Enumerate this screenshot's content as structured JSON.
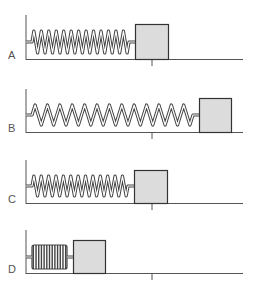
{
  "figure": {
    "colors": {
      "line": "#555555",
      "block_fill": "#dcdcdc",
      "block_stroke": "#333333",
      "spring_outer": "#444444",
      "spring_inner": "#ffffff"
    },
    "panels": [
      {
        "label": "A",
        "state": "equilibrium",
        "wall_x": 26,
        "wall_top": 15,
        "baseline_y": 59,
        "block": {
          "x": 135,
          "y": 24,
          "w": 33,
          "h": 35
        },
        "spring": {
          "x1": 26,
          "x2": 135,
          "coils": 13,
          "amp": 11,
          "cy": 42
        },
        "tick_x": 152
      },
      {
        "label": "B",
        "state": "stretched",
        "wall_x": 26,
        "wall_top": 89,
        "baseline_y": 132,
        "block": {
          "x": 199,
          "y": 98,
          "w": 32,
          "h": 34
        },
        "spring": {
          "x1": 26,
          "x2": 199,
          "coils": 13,
          "amp": 10,
          "cy": 115
        },
        "tick_x": 152
      },
      {
        "label": "C",
        "state": "equilibrium",
        "wall_x": 26,
        "wall_top": 160,
        "baseline_y": 203,
        "block": {
          "x": 134,
          "y": 170,
          "w": 33,
          "h": 33
        },
        "spring": {
          "x1": 26,
          "x2": 134,
          "coils": 13,
          "amp": 10,
          "cy": 186
        },
        "tick_x": 152
      },
      {
        "label": "D",
        "state": "compressed",
        "wall_x": 26,
        "wall_top": 230,
        "baseline_y": 273,
        "block": {
          "x": 73,
          "y": 240,
          "w": 32,
          "h": 33
        },
        "spring": {
          "x1": 26,
          "x2": 73,
          "coils": 13,
          "amp": 12,
          "cy": 257
        },
        "tick_x": 152
      }
    ]
  }
}
